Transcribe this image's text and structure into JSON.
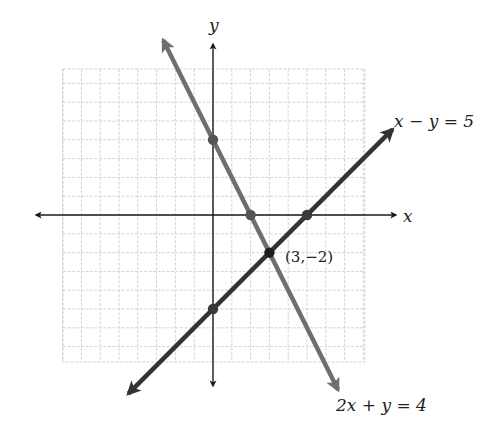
{
  "chart_data": {
    "type": "line",
    "title": "",
    "xlabel": "x",
    "ylabel": "y",
    "xlim": [
      -8,
      8
    ],
    "ylim": [
      -7.8,
      7.8
    ],
    "grid": true,
    "series": [
      {
        "name": "2x + y = 4",
        "label": "2x + y = 4",
        "slope": -2,
        "intercept": 4,
        "color": "#6e6e6e",
        "points": [
          {
            "x": 0,
            "y": 4
          },
          {
            "x": 2,
            "y": 0
          }
        ],
        "x_range": [
          -2.65,
          6.65
        ]
      },
      {
        "name": "x - y = 5",
        "label": "x − y = 5",
        "slope": 1,
        "intercept": -5,
        "color": "#333333",
        "points": [
          {
            "x": 0,
            "y": -5
          },
          {
            "x": 5,
            "y": 0
          }
        ],
        "x_range": [
          -4.5,
          9.55
        ]
      }
    ],
    "intersection": {
      "x": 3,
      "y": -2,
      "label": "(3,−2)"
    },
    "annotations": [
      {
        "text": "x − y = 5",
        "near": "upper-right"
      },
      {
        "text": "2x + y = 4",
        "near": "lower-right"
      },
      {
        "text": "(3,−2)",
        "near": "intersection"
      }
    ]
  },
  "labels": {
    "x_axis": "x",
    "y_axis": "y",
    "line1": "2x + y = 4",
    "line2": "x − y = 5",
    "intersection": "(3,−2)"
  },
  "colors": {
    "grid": "#cfcfcf",
    "axis": "#1a1a1a",
    "line1": "#6e6e6e",
    "line2": "#333333",
    "point": "#3a3a3a"
  }
}
